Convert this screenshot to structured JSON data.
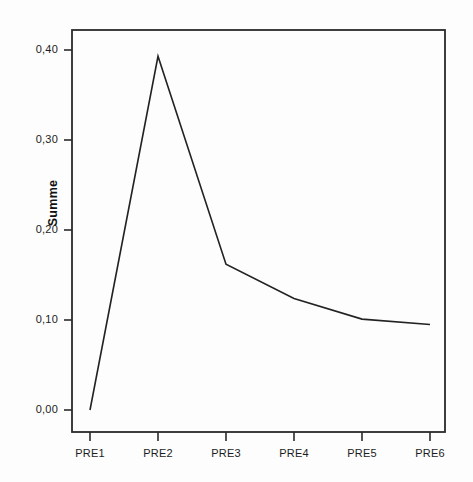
{
  "chart_data": {
    "type": "line",
    "title": "",
    "subtitle": "",
    "xlabel": "",
    "ylabel": "Summe",
    "categories": [
      "PRE1",
      "PRE2",
      "PRE3",
      "PRE4",
      "PRE5",
      "PRE6"
    ],
    "values": [
      0.0,
      0.393,
      0.162,
      0.124,
      0.101,
      0.095
    ],
    "series": [
      {
        "name": "Summe",
        "values": [
          0.0,
          0.393,
          0.162,
          0.124,
          0.101,
          0.095
        ]
      }
    ],
    "ylim": [
      -0.0244,
      0.4244
    ],
    "xlim": [
      0,
      7
    ],
    "ytick_values": [
      0.0,
      0.1,
      0.2,
      0.3,
      0.4
    ],
    "ytick_labels": [
      "0,00",
      "0,10",
      "0,20",
      "0,30",
      "0,40"
    ],
    "xtick_labels": [
      "PRE1",
      "PRE2",
      "PRE3",
      "PRE4",
      "PRE5",
      "PRE6"
    ],
    "grid": false,
    "legend": false,
    "legend_position": "none",
    "line_color": "#222222",
    "line_width": 1.6,
    "markers": false,
    "decimal_separator": ",",
    "background_color": "#fdfdfd",
    "axis_color": "#2a2a2a",
    "annotations": []
  },
  "axes": {
    "y_axis_title": "Summe",
    "y_ticks": [
      {
        "label": "0,40",
        "value": 0.4
      },
      {
        "label": "0,30",
        "value": 0.3
      },
      {
        "label": "0,20",
        "value": 0.2
      },
      {
        "label": "0,10",
        "value": 0.1
      },
      {
        "label": "0,00",
        "value": 0.0
      }
    ],
    "x_ticks": [
      {
        "label": "PRE1"
      },
      {
        "label": "PRE2"
      },
      {
        "label": "PRE3"
      },
      {
        "label": "PRE4"
      },
      {
        "label": "PRE5"
      },
      {
        "label": "PRE6"
      }
    ]
  }
}
